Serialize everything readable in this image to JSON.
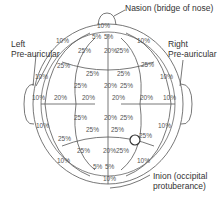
{
  "figure": {
    "callouts": {
      "nasion": "Nasion (bridge of nose)",
      "left_ear_line1": "Left",
      "left_ear_line2": "Pre-auricular",
      "right_ear_line1": "Right",
      "right_ear_line2": "Pre-auricular",
      "inion_line1": "Inion (occipital",
      "inion_line2": "protuberance)"
    },
    "percent_labels": [
      {
        "text": "10%",
        "x": 103,
        "y": 27
      },
      {
        "text": "5%",
        "x": 98,
        "y": 38
      },
      {
        "text": "5%",
        "x": 110,
        "y": 38
      },
      {
        "text": "10%",
        "x": 62,
        "y": 42
      },
      {
        "text": "10%",
        "x": 143,
        "y": 42
      },
      {
        "text": "25%",
        "x": 84,
        "y": 52
      },
      {
        "text": "20%",
        "x": 110,
        "y": 52
      },
      {
        "text": "25%",
        "x": 122,
        "y": 52
      },
      {
        "text": "25%",
        "x": 63,
        "y": 67
      },
      {
        "text": "25%",
        "x": 147,
        "y": 66
      },
      {
        "text": "25%",
        "x": 92,
        "y": 75
      },
      {
        "text": "25%",
        "x": 123,
        "y": 75
      },
      {
        "text": "10%",
        "x": 41,
        "y": 78
      },
      {
        "text": "10%",
        "x": 166,
        "y": 78
      },
      {
        "text": "25%",
        "x": 80,
        "y": 87
      },
      {
        "text": "20%",
        "x": 110,
        "y": 87
      },
      {
        "text": "25%",
        "x": 126,
        "y": 87
      },
      {
        "text": "10%",
        "x": 38,
        "y": 99
      },
      {
        "text": "20%",
        "x": 60,
        "y": 99
      },
      {
        "text": "20%",
        "x": 88,
        "y": 99
      },
      {
        "text": "20%",
        "x": 118,
        "y": 99
      },
      {
        "text": "20%",
        "x": 146,
        "y": 99
      },
      {
        "text": "10%",
        "x": 169,
        "y": 99
      },
      {
        "text": "25%",
        "x": 80,
        "y": 119
      },
      {
        "text": "20%",
        "x": 110,
        "y": 119
      },
      {
        "text": "25%",
        "x": 126,
        "y": 119
      },
      {
        "text": "10%",
        "x": 42,
        "y": 127
      },
      {
        "text": "10%",
        "x": 164,
        "y": 127
      },
      {
        "text": "25%",
        "x": 92,
        "y": 131
      },
      {
        "text": "25%",
        "x": 117,
        "y": 131
      },
      {
        "text": "25%",
        "x": 145,
        "y": 137
      },
      {
        "text": "25%",
        "x": 64,
        "y": 140
      },
      {
        "text": "25%",
        "x": 83,
        "y": 152
      },
      {
        "text": "20%",
        "x": 109,
        "y": 152
      },
      {
        "text": "25%",
        "x": 122,
        "y": 152
      },
      {
        "text": "10%",
        "x": 63,
        "y": 162
      },
      {
        "text": "10%",
        "x": 143,
        "y": 162
      },
      {
        "text": "5%",
        "x": 99,
        "y": 168
      },
      {
        "text": "5%",
        "x": 111,
        "y": 168
      },
      {
        "text": "10%",
        "x": 109,
        "y": 180
      }
    ],
    "highlighted_electrode": {
      "x": 135,
      "y": 140,
      "r": 5
    }
  }
}
